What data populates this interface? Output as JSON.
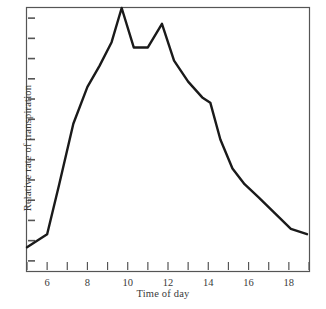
{
  "chart_data": {
    "type": "line",
    "title": "",
    "xlabel": "Time of day",
    "ylabel": "Relative rate of transpiration",
    "xlim": [
      5,
      19
    ],
    "ylim": [
      0,
      100
    ],
    "grid": false,
    "legend": null,
    "x_major_tick_labels": [
      "6",
      "8",
      "10",
      "12",
      "14",
      "16",
      "18"
    ],
    "x_major_tick_values": [
      6,
      8,
      10,
      12,
      14,
      16,
      18
    ],
    "x_all_tick_values": [
      5,
      6,
      7,
      8,
      9,
      10,
      11,
      12,
      13,
      14,
      15,
      16,
      17,
      18,
      19
    ],
    "y_tick_count": 13,
    "y_tick_labels": [],
    "series": [
      {
        "name": "Relative rate of transpiration",
        "x": [
          5.0,
          6.0,
          6.6,
          7.3,
          8.0,
          8.6,
          9.2,
          9.7,
          10.3,
          11.0,
          11.7,
          12.3,
          13.0,
          13.7,
          14.1,
          14.6,
          15.2,
          15.8,
          16.5,
          17.3,
          18.1,
          18.9
        ],
        "values": [
          9,
          14,
          33,
          56,
          70,
          78,
          87,
          100,
          85,
          85,
          94,
          80,
          72,
          66,
          64,
          50,
          39,
          33,
          28,
          22,
          16,
          14
        ]
      }
    ],
    "annotations": []
  },
  "figure": {
    "line_color": "#1a1a1a",
    "frame_color": "#555555",
    "background": "#ffffff"
  }
}
